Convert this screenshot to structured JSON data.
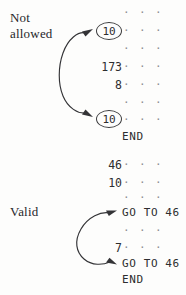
{
  "figure": {
    "background_color": "#fdfdfc",
    "ink_color": "#2d2d2f",
    "dot_color": "#8d8d92"
  },
  "blocks": [
    {
      "id": "not-allowed",
      "label_line1": "Not",
      "label_line2": "allowed",
      "end_label": "END",
      "lines": [
        {
          "number": "",
          "circled": false,
          "text": "· · ·"
        },
        {
          "number": "10",
          "circled": true,
          "text": "· · ·"
        },
        {
          "number": "",
          "circled": false,
          "text": "· · ·"
        },
        {
          "number": "173",
          "circled": false,
          "text": "· · ·"
        },
        {
          "number": "8",
          "circled": false,
          "text": "· · ·"
        },
        {
          "number": "",
          "circled": false,
          "text": "· · ·"
        },
        {
          "number": "10",
          "circled": true,
          "text": "· · ·"
        }
      ]
    },
    {
      "id": "valid",
      "label_line1": "Valid",
      "label_line2": "",
      "end_label": "END",
      "lines": [
        {
          "number": "46",
          "circled": false,
          "text": "· · ·"
        },
        {
          "number": "10",
          "circled": false,
          "text": "· · ·"
        },
        {
          "number": "",
          "circled": false,
          "text": "· · ·"
        },
        {
          "number": "",
          "circled": false,
          "text": "GO TO 46"
        },
        {
          "number": "",
          "circled": false,
          "text": "· · ·"
        },
        {
          "number": "7",
          "circled": false,
          "text": "· · ·"
        },
        {
          "number": "",
          "circled": false,
          "text": "GO TO 46"
        }
      ]
    }
  ],
  "annotations": {
    "arrow_top_label": "",
    "arrow_bottom_label": ""
  },
  "text": {
    "not_allowed_line1": "Not",
    "not_allowed_line2": "allowed",
    "valid_label": "Valid",
    "end": "END",
    "dots": "· · ·",
    "goto46": "GO TO 46",
    "num_173": "173",
    "num_8": "8",
    "num_10": "10",
    "num_46": "46",
    "num_7": "7",
    "circled_10_a": "10",
    "circled_10_b": "10"
  }
}
